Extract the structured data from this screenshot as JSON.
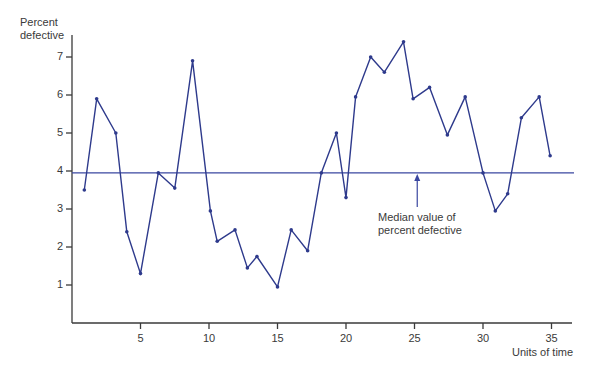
{
  "chart_data": {
    "type": "line",
    "title": "",
    "ylabel": "Percent defective",
    "xlabel": "Units of time",
    "xlim": [
      0,
      37
    ],
    "ylim": [
      0,
      7.6
    ],
    "x_ticks": [
      5,
      10,
      15,
      20,
      25,
      30,
      35
    ],
    "y_ticks": [
      1,
      2,
      3,
      4,
      5,
      6,
      7
    ],
    "grid": false,
    "legend": null,
    "series": [
      {
        "name": "Percent defective",
        "color": "#2e3a8c",
        "x": [
          0.9,
          1.8,
          3.2,
          4.0,
          5.0,
          6.3,
          7.5,
          8.8,
          10.1,
          10.6,
          11.9,
          12.8,
          13.5,
          15.0,
          16.0,
          17.2,
          18.2,
          19.3,
          20.0,
          20.7,
          21.8,
          22.8,
          24.2,
          24.9,
          26.1,
          27.4,
          28.7,
          30.0,
          30.9,
          31.8,
          32.8,
          34.1,
          34.9
        ],
        "values": [
          3.5,
          5.9,
          5.0,
          2.4,
          1.3,
          3.95,
          3.55,
          6.9,
          2.95,
          2.15,
          2.45,
          1.45,
          1.75,
          0.95,
          2.45,
          1.9,
          3.95,
          5.0,
          3.3,
          5.95,
          7.0,
          6.6,
          7.4,
          5.9,
          6.2,
          4.95,
          5.95,
          3.95,
          2.95,
          3.4,
          5.4,
          5.95,
          4.4
        ]
      }
    ],
    "reference_lines": [
      {
        "name": "Median",
        "y": 3.95,
        "color": "#3a47a0"
      }
    ],
    "annotations": [
      {
        "text": "Median value of\npercent defective",
        "arrow_to_x": 25.2,
        "arrow_to_y": 3.95
      }
    ]
  },
  "labels": {
    "ylabel_line1": "Percent",
    "ylabel_line2": "defective",
    "xlabel": "Units of time",
    "annotation_line1": "Median value of",
    "annotation_line2": "percent defective",
    "yticks": [
      "1",
      "2",
      "3",
      "4",
      "5",
      "6",
      "7"
    ],
    "xticks": [
      "5",
      "10",
      "15",
      "20",
      "25",
      "30",
      "35"
    ]
  }
}
